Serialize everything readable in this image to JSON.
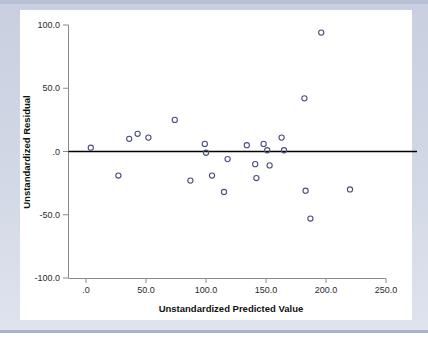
{
  "window": {
    "background_color": "#ccd2e2",
    "card_color": "#ffffff"
  },
  "chart_data": {
    "type": "scatter",
    "title": "",
    "xlabel": "Unstandardized Predicted Value",
    "ylabel": "Unstandardized Residual",
    "xlim": [
      0,
      250
    ],
    "ylim": [
      -100,
      100
    ],
    "xticks": [
      0,
      50,
      100,
      150,
      200,
      250
    ],
    "yticks": [
      100,
      50,
      0,
      -50,
      -100
    ],
    "xtick_labels": [
      ".0",
      "50.0",
      "100.0",
      "150.0",
      "200.0",
      "250.0"
    ],
    "ytick_labels": [
      "100.0",
      "50.0",
      ".0",
      "-50.0",
      "-100.0"
    ],
    "grid": false,
    "legend": null,
    "marker": {
      "shape": "open-circle",
      "color": "#4a4f7a",
      "size": 4
    },
    "reference_line": {
      "type": "horizontal",
      "y": 0,
      "color": "#000000"
    },
    "points": [
      {
        "x": 4,
        "y": 3
      },
      {
        "x": 27,
        "y": -19
      },
      {
        "x": 36,
        "y": 10
      },
      {
        "x": 43,
        "y": 14
      },
      {
        "x": 52,
        "y": 11
      },
      {
        "x": 74,
        "y": 25
      },
      {
        "x": 87,
        "y": -23
      },
      {
        "x": 99,
        "y": 6
      },
      {
        "x": 100,
        "y": -1
      },
      {
        "x": 105,
        "y": -19
      },
      {
        "x": 115,
        "y": -32
      },
      {
        "x": 118,
        "y": -6
      },
      {
        "x": 134,
        "y": 5
      },
      {
        "x": 141,
        "y": -10
      },
      {
        "x": 142,
        "y": -21
      },
      {
        "x": 148,
        "y": 6
      },
      {
        "x": 151,
        "y": 1
      },
      {
        "x": 153,
        "y": -11
      },
      {
        "x": 163,
        "y": 11
      },
      {
        "x": 165,
        "y": 1
      },
      {
        "x": 182,
        "y": 42
      },
      {
        "x": 183,
        "y": -31
      },
      {
        "x": 187,
        "y": -53
      },
      {
        "x": 196,
        "y": 94
      },
      {
        "x": 220,
        "y": -30
      }
    ]
  }
}
